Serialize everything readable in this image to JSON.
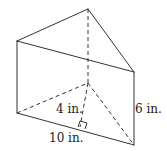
{
  "diagram": {
    "type": "triangular-prism",
    "stroke_color": "#333333",
    "labels": {
      "height_label": "4 in.",
      "base_label": "10 in.",
      "length_label": "6 in."
    }
  }
}
